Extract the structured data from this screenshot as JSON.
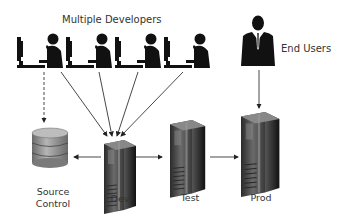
{
  "diagram": {
    "title_developers": "Multiple Developers",
    "title_end_users": "End Users",
    "nodes": {
      "source_control": {
        "label_line1": "Source",
        "label_line2": "Control",
        "icon": "database-icon"
      },
      "dev": {
        "label": "Dev",
        "icon": "server-icon"
      },
      "test": {
        "label": "Test",
        "icon": "server-icon"
      },
      "prod": {
        "label": "Prod",
        "icon": "server-icon"
      }
    },
    "actors": {
      "developers": {
        "count": 4,
        "icon": "developer-at-computer-icon"
      },
      "end_user": {
        "icon": "businessman-icon"
      }
    },
    "edges": [
      {
        "from": "developer-1",
        "to": "source_control",
        "style": "dashed"
      },
      {
        "from": "developer-1",
        "to": "dev",
        "style": "solid"
      },
      {
        "from": "developer-2",
        "to": "dev",
        "style": "solid"
      },
      {
        "from": "developer-3",
        "to": "dev",
        "style": "solid"
      },
      {
        "from": "developer-4",
        "to": "dev",
        "style": "solid"
      },
      {
        "from": "dev",
        "to": "source_control",
        "style": "solid"
      },
      {
        "from": "dev",
        "to": "test",
        "style": "solid"
      },
      {
        "from": "test",
        "to": "prod",
        "style": "solid"
      },
      {
        "from": "end_user",
        "to": "prod",
        "style": "solid"
      }
    ]
  }
}
